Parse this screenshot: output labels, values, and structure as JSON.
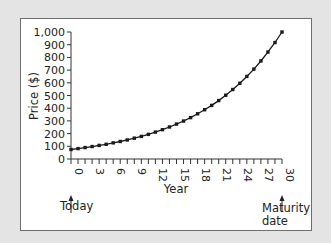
{
  "chart_data": {
    "type": "line",
    "title": "",
    "xlabel": "Year",
    "ylabel": "Price ($)",
    "xlim": [
      0,
      30
    ],
    "ylim": [
      0,
      1000
    ],
    "grid": false,
    "legend": null,
    "x_ticks": [
      0,
      3,
      6,
      9,
      12,
      15,
      18,
      21,
      24,
      27,
      30
    ],
    "x_tick_labels": [
      "0",
      "3",
      "6",
      "9",
      "12",
      "15",
      "18",
      "21",
      "24",
      "27",
      "30"
    ],
    "y_ticks": [
      0,
      100,
      200,
      300,
      400,
      500,
      600,
      700,
      800,
      900,
      1000
    ],
    "y_tick_labels": [
      "0",
      "100",
      "200",
      "300",
      "400",
      "500",
      "600",
      "700",
      "800",
      "900",
      "1,000"
    ],
    "series": [
      {
        "name": "Zero-coupon bond price",
        "marker": "square",
        "color": "#1a1a1a",
        "x": [
          0,
          1,
          2,
          3,
          4,
          5,
          6,
          7,
          8,
          9,
          10,
          11,
          12,
          13,
          14,
          15,
          16,
          17,
          18,
          19,
          20,
          21,
          22,
          23,
          24,
          25,
          26,
          27,
          28,
          29,
          30
        ],
        "values": [
          75,
          82,
          90,
          98,
          107,
          116,
          127,
          138,
          150,
          164,
          178,
          194,
          212,
          231,
          252,
          275,
          299,
          326,
          356,
          388,
          422,
          460,
          502,
          547,
          596,
          650,
          708,
          772,
          842,
          917,
          1000
        ]
      }
    ],
    "annotations": [
      {
        "text": "Today",
        "x": 0,
        "arrow": "up"
      },
      {
        "text": "Maturity date",
        "lines": [
          "Maturity",
          "date"
        ],
        "x": 30,
        "arrow": "up"
      }
    ]
  },
  "labels": {
    "ylabel": "Price ($)",
    "xlabel": "Year",
    "today": "Today",
    "maturity_line1": "Maturity",
    "maturity_line2": "date"
  },
  "colors": {
    "background": "#e4e4e4",
    "panel": "#ffffff",
    "line": "#1a1a1a"
  }
}
